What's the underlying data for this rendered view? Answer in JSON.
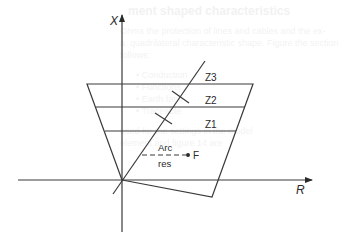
{
  "figure": {
    "axes": {
      "vertical_label": "X",
      "horizontal_label": "R"
    },
    "zones": [
      {
        "label": "Z1"
      },
      {
        "label": "Z2"
      },
      {
        "label": "Z3"
      }
    ],
    "arc_resistance": {
      "label_top": "Arc",
      "label_bottom": "res",
      "fault_label": "F"
    },
    "colors": {
      "line": "#3a3a3a",
      "background": "#ffffff"
    }
  },
  "bleed_through": {
    "title": "ment shaped characteristics",
    "lines": [
      "Ohms the protection of lines and cables and the ex-",
      "a. quadrilateral characteristic shape. Figure the section",
      "follows:",
      "• Conduction",
      "• Functions",
      "• Earth fault",
      "• Traceable",
      "used for the settings in the model",
      "element and figure 14 are"
    ]
  }
}
